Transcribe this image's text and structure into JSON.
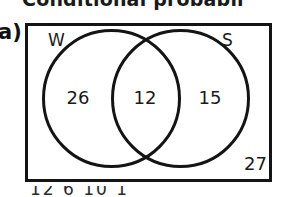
{
  "heading": {
    "text": "Conditional probabil"
  },
  "part": {
    "label": "a)"
  },
  "diagram": {
    "type": "venn-two-set",
    "universal_set_label": "",
    "sets": [
      {
        "id": "W",
        "label": "W",
        "position": "left"
      },
      {
        "id": "S",
        "label": "S",
        "position": "right"
      }
    ],
    "regions": {
      "w_only": "26",
      "intersection": "12",
      "s_only": "15",
      "outside": "27"
    },
    "colors": {
      "stroke": "#141414",
      "background": "#ffffff",
      "text": "#1a1a1a"
    }
  },
  "footer": {
    "text": "12      6          10       1"
  },
  "chart_data": {
    "type": "venn",
    "title": "Conditional probabil",
    "categories": [
      "W only",
      "W ∩ S",
      "S only",
      "Outside (neither)"
    ],
    "values": [
      26,
      12,
      15,
      27
    ],
    "set_labels": [
      "W",
      "S"
    ],
    "total": 80
  }
}
